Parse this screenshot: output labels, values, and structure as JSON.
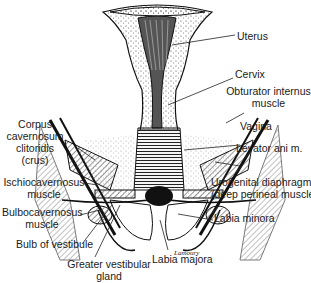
{
  "figure": {
    "labels": {
      "uterus": "Uterus",
      "cervix": "Cervix",
      "obturator_internus": [
        "Obturator internus",
        "muscle"
      ],
      "vagina": "Vagina",
      "levator_ani": "Levator ani m.",
      "urogenital_diaphragm": [
        "Urogenital diaphragm",
        "(deep perineal muscle)"
      ],
      "labia_minora": "Labia minora",
      "labia_majora": "Labia majora",
      "corpus_cavernosum": [
        "Corpus",
        "cavernosum",
        "clitoridis",
        "(crus)"
      ],
      "ischiocavernosus": [
        "Ischiocavernosus",
        "muscle"
      ],
      "bulbocavernosus": [
        "Bulbocavernosus",
        "muscle"
      ],
      "bulb_of_vestibule": "Bulb of vestibule",
      "greater_vestibular_gland": [
        "Greater vestibular",
        "gland"
      ]
    },
    "signature": "Lamoury"
  }
}
